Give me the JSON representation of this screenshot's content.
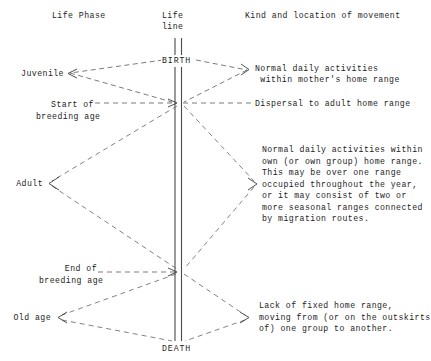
{
  "diagram": {
    "headers": {
      "left": "Life Phase",
      "center_line1": "Life",
      "center_line2": "line",
      "right": "Kind and location of movement"
    },
    "lifeline": {
      "milestones": [
        {
          "id": "birth",
          "label": "BIRTH"
        },
        {
          "id": "death",
          "label": "DEATH"
        }
      ]
    },
    "phases": [
      {
        "id": "juvenile",
        "label": "Juvenile"
      },
      {
        "id": "start-breeding",
        "label": "Start of\nbreeding age"
      },
      {
        "id": "adult",
        "label": "Adult"
      },
      {
        "id": "end-breeding",
        "label": "End of\nbreeding age"
      },
      {
        "id": "old-age",
        "label": "Old age"
      }
    ],
    "movements": [
      {
        "id": "juvenile-movement",
        "lines": [
          "Normal daily activities",
          " within mother's home range"
        ]
      },
      {
        "id": "dispersal-movement",
        "lines": [
          "Dispersal to adult home range"
        ]
      },
      {
        "id": "adult-movement",
        "lines": [
          "Normal daily activities within",
          "own (or own group) home range.",
          "This may be over one range",
          "occupied throughout the year,",
          "or it may consist of two or",
          "more seasonal ranges connected",
          "by migration routes."
        ]
      },
      {
        "id": "old-age-movement",
        "lines": [
          "Lack of fixed home range,",
          "moving from (or on the outskirts",
          "of) one group to another."
        ]
      }
    ],
    "colors": {
      "ink": "#1c1c1c",
      "line": "#555555",
      "background": "#ffffff"
    }
  }
}
